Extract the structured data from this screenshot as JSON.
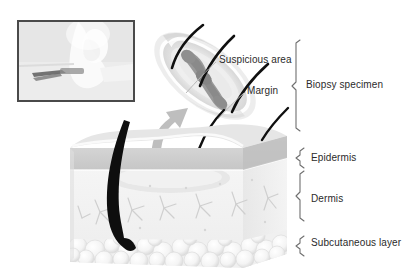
{
  "figure": {
    "labels": {
      "suspicious_area": "Suspicious area",
      "margin": "Margin",
      "biopsy_specimen": "Biopsy specimen",
      "epidermis": "Epidermis",
      "dermis": "Dermis",
      "subcutaneous_layer": "Subcutaneous layer"
    },
    "icons": {
      "inset_photo": "clinical-photo-scalpel-inset",
      "transfer_arrow": "curved-up-arrow",
      "bracket_biopsy": "brace-bracket",
      "bracket_epidermis": "brace-bracket",
      "bracket_dermis": "brace-bracket",
      "bracket_subq": "brace-bracket"
    },
    "colors": {
      "text": "#2b2b2b",
      "lesion": "#8c8c8c",
      "specimen_tissue": "#e9e9e9",
      "specimen_rim": "#d6d6d6",
      "epidermis": "#cfcfcf",
      "epidermis_top": "#e2e2e2",
      "dermis": "#f2f2f2",
      "subcutaneous": "#ededed",
      "hair": "#101010",
      "leader_line": "#b3b3b3",
      "arrow": "#b5b5b5",
      "bracket": "#6f6f6f",
      "inset_border": "#4a4a4a",
      "inset_fill": "#e8e8e8"
    },
    "anatomy_layers": [
      {
        "name": "Epidermis",
        "order": 1
      },
      {
        "name": "Dermis",
        "order": 2
      },
      {
        "name": "Subcutaneous layer",
        "order": 3
      }
    ],
    "specimen_features": [
      {
        "name": "Suspicious area"
      },
      {
        "name": "Margin"
      }
    ]
  }
}
